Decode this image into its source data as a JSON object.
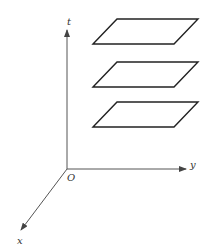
{
  "diagram": {
    "axes": {
      "t": {
        "label": "t"
      },
      "y": {
        "label": "y"
      },
      "x": {
        "label": "x"
      },
      "origin": {
        "label": "O"
      }
    },
    "planes": [
      {
        "name": "top"
      },
      {
        "name": "middle"
      },
      {
        "name": "bottom"
      }
    ],
    "colors": {
      "line": "#222222",
      "axis": "#555555",
      "background": "#ffffff"
    }
  }
}
